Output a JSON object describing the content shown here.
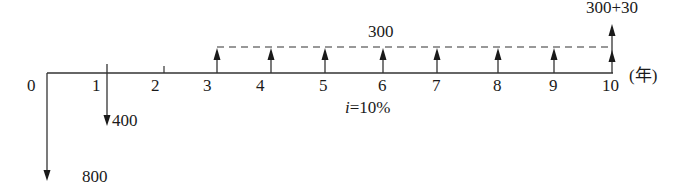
{
  "diagram": {
    "unit_label": "(年)",
    "interest_label": "i=10%",
    "interest_var": "i",
    "interest_value": "=10%",
    "axis": {
      "y": 73,
      "x_start": 47,
      "x_end": 613,
      "color": "#333333"
    },
    "dashed_line": {
      "y": 47,
      "x_start": 217,
      "x_end": 612
    },
    "years": [
      {
        "label": "0",
        "x": 47
      },
      {
        "label": "1",
        "x": 107
      },
      {
        "label": "2",
        "x": 164
      },
      {
        "label": "3",
        "x": 217
      },
      {
        "label": "4",
        "x": 271
      },
      {
        "label": "5",
        "x": 325
      },
      {
        "label": "6",
        "x": 383
      },
      {
        "label": "7",
        "x": 437
      },
      {
        "label": "8",
        "x": 498
      },
      {
        "label": "9",
        "x": 554
      },
      {
        "label": "10",
        "x": 612
      }
    ],
    "cash_flows": [
      {
        "year": 0,
        "direction": "out",
        "amount_label": "800"
      },
      {
        "year": 1,
        "direction": "out",
        "amount_label": "400"
      },
      {
        "year": 3,
        "direction": "in",
        "amount_label": "300"
      },
      {
        "year": 4,
        "direction": "in",
        "amount_label": "300"
      },
      {
        "year": 5,
        "direction": "in",
        "amount_label": "300"
      },
      {
        "year": 6,
        "direction": "in",
        "amount_label": "300"
      },
      {
        "year": 7,
        "direction": "in",
        "amount_label": "300"
      },
      {
        "year": 8,
        "direction": "in",
        "amount_label": "300"
      },
      {
        "year": 9,
        "direction": "in",
        "amount_label": "300"
      },
      {
        "year": 10,
        "direction": "in",
        "amount_label": "300+30"
      }
    ],
    "annuity_label": "300",
    "final_label": "300+30",
    "outflow_800_label": "800",
    "outflow_400_label": "400"
  }
}
